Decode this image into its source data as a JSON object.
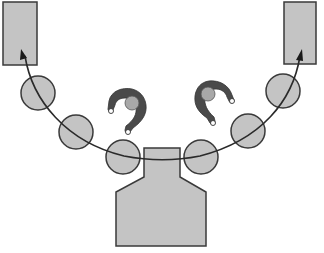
{
  "diagram": {
    "colors": {
      "fill_gray": "#c4c4c4",
      "stroke": "#3a3a3a",
      "operator_body": "#4a4a4a",
      "operator_head": "#a8a8a8",
      "background": "#ffffff"
    },
    "storage_racks": [
      {
        "id": "left-rack",
        "x": 3,
        "y": 2,
        "w": 34,
        "h": 63
      },
      {
        "id": "right-rack",
        "x": 284,
        "y": 2,
        "w": 32,
        "h": 62
      }
    ],
    "stations": [
      {
        "id": 1,
        "cx": 38,
        "cy": 93,
        "r": 17
      },
      {
        "id": 2,
        "cx": 76,
        "cy": 132,
        "r": 17
      },
      {
        "id": 3,
        "cx": 123,
        "cy": 157,
        "r": 17
      },
      {
        "id": 4,
        "cx": 201,
        "cy": 157,
        "r": 17
      },
      {
        "id": 5,
        "cx": 248,
        "cy": 131,
        "r": 17
      },
      {
        "id": 6,
        "cx": 283,
        "cy": 91,
        "r": 17
      }
    ],
    "machine": {
      "points": "144,148 180,148 180,177 206,192 206,246 116,246 116,192 144,177"
    },
    "flow_path": {
      "d": "M 300,52 C 292,100 262,140 200,156 C 175,162 150,162 124,156 C 66,142 32,100 25,52",
      "arrowheads": [
        {
          "at": "left-rack",
          "x": 21,
          "y": 52,
          "direction": "up"
        },
        {
          "at": "right-rack",
          "x": 300,
          "y": 52,
          "direction": "up"
        }
      ]
    },
    "operators": [
      {
        "id": "operator-left",
        "x": 128,
        "y": 108,
        "rotation": -30
      },
      {
        "id": "operator-right",
        "x": 212,
        "y": 97,
        "rotation": 40
      }
    ]
  }
}
